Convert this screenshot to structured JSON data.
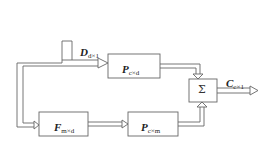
{
  "diagram": {
    "input": {
      "symbol": "D",
      "subscript": "d×1"
    },
    "output": {
      "symbol": "C",
      "subscript": "c×1"
    },
    "blocks": [
      {
        "id": "p_cd",
        "symbol": "P",
        "subscript": "c×d"
      },
      {
        "id": "f_md",
        "symbol": "F",
        "subscript": "m×d"
      },
      {
        "id": "p_cm",
        "symbol": "P",
        "subscript": "c×m"
      }
    ],
    "summer": {
      "symbol": "Σ"
    },
    "colors": {
      "line": "#666666",
      "fill": "#ffffff",
      "text": "#222222"
    }
  }
}
